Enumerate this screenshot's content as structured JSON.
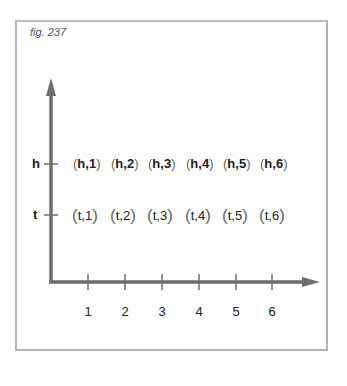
{
  "figure": {
    "label": "fig. 237"
  },
  "axes": {
    "y_labels": [
      "h",
      "t"
    ],
    "x_labels": [
      "1",
      "2",
      "3",
      "4",
      "5",
      "6"
    ]
  },
  "outcomes": {
    "h_row": [
      "h,1",
      "h,2",
      "h,3",
      "h,4",
      "h,5",
      "h,6"
    ],
    "t_row": [
      "t,1",
      "t,2",
      "t,3",
      "t,4",
      "t,5",
      "t,6"
    ]
  },
  "colors": {
    "axis": "#6e6e6e",
    "frame": "#b4b4b4",
    "text": "#222222"
  }
}
